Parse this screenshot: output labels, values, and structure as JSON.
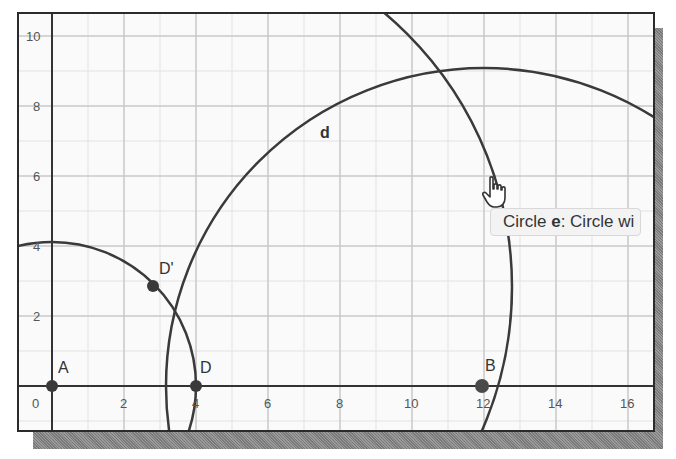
{
  "graphics_view": {
    "x_axis": {
      "ticks": [
        "0",
        "2",
        "4",
        "6",
        "8",
        "10",
        "12",
        "14",
        "16"
      ]
    },
    "y_axis": {
      "ticks": [
        "2",
        "4",
        "6",
        "8",
        "10"
      ]
    },
    "points": [
      {
        "label": "A",
        "x": 0,
        "y": 0
      },
      {
        "label": "D",
        "x": 4,
        "y": 0
      },
      {
        "label": "D'",
        "x": 2.83,
        "y": 2.83
      },
      {
        "label": "B",
        "x": 12,
        "y": 0
      }
    ],
    "circles": [
      {
        "name": "c",
        "center": "A",
        "radius": 4
      },
      {
        "name": "d",
        "center": "B",
        "radius": 9
      },
      {
        "name": "e",
        "center": "D'",
        "radius": 10
      }
    ],
    "circle_label": "d",
    "tooltip": {
      "prefix": "Circle ",
      "name": "e",
      "suffix": ": Circle wi"
    },
    "cursor": "hand-pointer"
  }
}
